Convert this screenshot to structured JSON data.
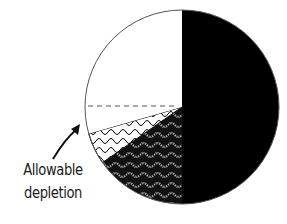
{
  "chart_data": {
    "type": "pie",
    "title": "",
    "center": [
      182,
      107
    ],
    "radius": 97,
    "start_angle_deg": 0,
    "direction": "clockwise",
    "slices": [
      {
        "name": "solid",
        "fill": "black",
        "value": 50.0,
        "start_deg": 0,
        "end_deg": 180
      },
      {
        "name": "stippled-wavy",
        "fill": "stipple",
        "value": 15.2,
        "start_deg": 180,
        "end_deg": 235
      },
      {
        "name": "wavy-lines",
        "fill": "waves",
        "value": 5.4,
        "start_deg": 235,
        "end_deg": 254
      },
      {
        "name": "white-lower",
        "fill": "white",
        "value": 4.4,
        "start_deg": 254,
        "end_deg": 270
      },
      {
        "name": "white-upper",
        "fill": "white",
        "value": 25.0,
        "start_deg": 270,
        "end_deg": 360
      }
    ],
    "dashed_line": {
      "from_deg": 270,
      "description": "horizontal dashed line at center level within white region"
    },
    "annotations": [
      {
        "text": "Allowable depletion",
        "arrow_to": [
          80,
          124
        ],
        "arrow_from": [
          53,
          159
        ]
      }
    ],
    "legend": "none"
  },
  "labels": {
    "annotation_line1": "Allowable",
    "annotation_line2": "depletion"
  },
  "colors": {
    "black": "#000000",
    "white": "#ffffff",
    "outline": "#555555",
    "text": "#1a1a1a"
  }
}
